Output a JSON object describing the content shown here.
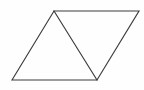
{
  "figure": {
    "shape_name": "parallelogram",
    "background_color": "#fefefe",
    "stroke_color": "#3b3b3b",
    "stroke_width": 1.15,
    "canvas": {
      "width": 144,
      "height": 90
    },
    "vertices": {
      "bottom_left": {
        "label": "A",
        "x": 12,
        "y": 80
      },
      "top_left": {
        "label": "B",
        "x": 54,
        "y": 11
      },
      "top_right": {
        "label": "C",
        "x": 139,
        "y": 11
      },
      "bottom_right": {
        "label": "D",
        "x": 97,
        "y": 80
      }
    },
    "outline_points": "12,80 54,11 139,11 97,80",
    "divider": {
      "name": "internal-diagonal",
      "from": {
        "x": 54,
        "y": 11
      },
      "to": {
        "x": 97,
        "y": 80
      }
    },
    "regions": [
      {
        "name": "left-triangle",
        "points": "12,80 54,11 97,80",
        "fill": "none"
      },
      {
        "name": "right-triangle",
        "points": "54,11 139,11 97,80",
        "fill": "none"
      }
    ],
    "labels": []
  }
}
